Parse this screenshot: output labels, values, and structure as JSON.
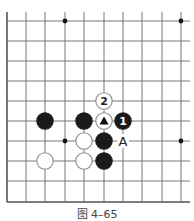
{
  "diagram": {
    "caption": "图 4–65",
    "grid": {
      "columns_x": [
        7,
        26,
        45,
        65,
        84,
        104,
        123,
        142,
        162,
        181
      ],
      "rows_y": [
        21,
        41,
        61,
        81,
        101,
        121,
        141,
        161,
        181,
        202
      ],
      "right_extent": 190,
      "top_extent": 12,
      "left_edge_is_board_edge": true,
      "bottom_edge_is_board_edge": true
    },
    "star_points": [
      {
        "col": 3,
        "row": 0
      },
      {
        "col": 9,
        "row": 0
      },
      {
        "col": 3,
        "row": 6
      },
      {
        "col": 9,
        "row": 6
      }
    ],
    "stones": [
      {
        "color": "black",
        "col": 2,
        "row": 5,
        "label": ""
      },
      {
        "color": "black",
        "col": 4,
        "row": 5,
        "label": ""
      },
      {
        "color": "white",
        "col": 5,
        "row": 5,
        "label": "",
        "mark": "triangle"
      },
      {
        "color": "black",
        "col": 6,
        "row": 5,
        "label": "1"
      },
      {
        "color": "white",
        "col": 5,
        "row": 4,
        "label": "2"
      },
      {
        "color": "white",
        "col": 4,
        "row": 6,
        "label": ""
      },
      {
        "color": "black",
        "col": 5,
        "row": 6,
        "label": ""
      },
      {
        "color": "white",
        "col": 2,
        "row": 7,
        "label": ""
      },
      {
        "color": "white",
        "col": 4,
        "row": 7,
        "label": ""
      },
      {
        "color": "black",
        "col": 5,
        "row": 7,
        "label": ""
      }
    ],
    "point_labels": [
      {
        "text": "A",
        "col": 6,
        "row": 6
      }
    ],
    "colors": {
      "line": "#6a6a6a",
      "edge": "#555555",
      "black_stone": "#1a1a1a",
      "white_stone_fill": "#ffffff",
      "white_stone_stroke": "#8a8a8a"
    }
  }
}
